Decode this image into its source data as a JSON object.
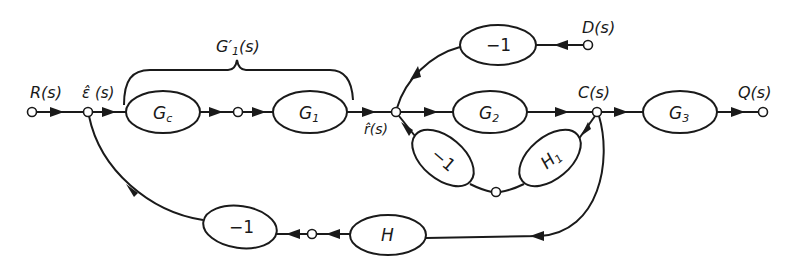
{
  "diagram": {
    "type": "signal-flow block diagram",
    "signals": {
      "input": "R(s)",
      "error": "ε̂ (s)",
      "ref": "r̂(s)",
      "output_c": "C(s)",
      "output_q": "Q(s)",
      "disturbance": "D(s)"
    },
    "group_label": {
      "main": "G′",
      "sub": "1",
      "tail": "(s)"
    },
    "blocks": {
      "gc": {
        "main": "G",
        "sub": "c"
      },
      "g1": {
        "main": "G",
        "sub": "1"
      },
      "g2": {
        "main": "G",
        "sub": "2"
      },
      "g3": {
        "main": "G",
        "sub": "3"
      },
      "h1": {
        "main": "H",
        "sub": "1"
      },
      "h": {
        "main": "H"
      },
      "neg_d": "−1",
      "neg_inner": "−1",
      "neg_outer": "−1"
    },
    "edges": [
      {
        "from": "R(s)",
        "to": "ε̂ (s)"
      },
      {
        "from": "ε̂ (s)",
        "to": "Gc"
      },
      {
        "from": "Gc",
        "to": "node"
      },
      {
        "from": "node",
        "to": "G1"
      },
      {
        "from": "G1",
        "to": "r̂(s)"
      },
      {
        "from": "r̂(s)",
        "to": "G2"
      },
      {
        "from": "G2",
        "to": "C(s)"
      },
      {
        "from": "C(s)",
        "to": "G3"
      },
      {
        "from": "G3",
        "to": "Q(s)"
      },
      {
        "from": "D(s)",
        "to": "−1 (top)"
      },
      {
        "from": "−1 (top)",
        "to": "r̂(s)"
      },
      {
        "from": "C(s)",
        "to": "H1"
      },
      {
        "from": "H1",
        "to": "−1 (inner)"
      },
      {
        "from": "−1 (inner)",
        "to": "r̂(s)"
      },
      {
        "from": "C(s)",
        "to": "H"
      },
      {
        "from": "H",
        "to": "−1 (outer)"
      },
      {
        "from": "−1 (outer)",
        "to": "ε̂ (s)"
      }
    ]
  }
}
